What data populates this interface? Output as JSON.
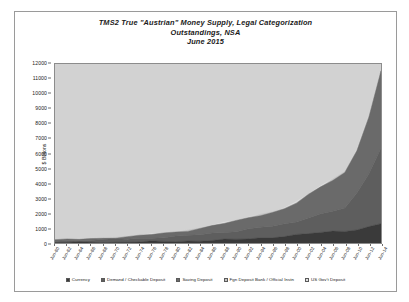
{
  "chart_data": {
    "type": "area",
    "stacked": true,
    "title": "TMS2 True \"Austrian\" Money Supply, Legal Categorization",
    "subtitle": "Outstandings, NSA",
    "subtitle2": "June 2015",
    "xlabel": "",
    "ylabel": "$ Billions",
    "ylim": [
      0,
      12000
    ],
    "ytick_step": 1000,
    "grid": false,
    "legend_position": "bottom",
    "plot_background": "#d2d2d2",
    "ytick_labels": [
      "0",
      "1000",
      "2000",
      "3000",
      "4000",
      "5000",
      "6000",
      "7000",
      "8000",
      "9000",
      "10000",
      "11000",
      "12000"
    ],
    "categories": [
      "Jun-60",
      "Jun-62",
      "Jun-64",
      "Jun-66",
      "Jun-68",
      "Jun-70",
      "Jun-72",
      "Jun-74",
      "Jun-76",
      "Jun-78",
      "Jun-80",
      "Jun-82",
      "Jun-84",
      "Jun-86",
      "Jun-88",
      "Jun-90",
      "Jun-92",
      "Jun-94",
      "Jun-96",
      "Jun-98",
      "Jun-00",
      "Jun-02",
      "Jun-04",
      "Jun-06",
      "Jun-08",
      "Jun-10",
      "Jun-12",
      "Jun-14"
    ],
    "series": [
      {
        "name": "Currency",
        "color": "#3a3a3a",
        "values": [
          30,
          34,
          38,
          42,
          48,
          55,
          62,
          72,
          85,
          100,
          118,
          135,
          155,
          180,
          210,
          245,
          285,
          340,
          395,
          450,
          530,
          620,
          700,
          780,
          830,
          900,
          1070,
          1290
        ]
      },
      {
        "name": "Demand / Checkable Deposit",
        "color": "#5e5e5e",
        "values": [
          120,
          128,
          140,
          152,
          168,
          190,
          210,
          240,
          265,
          290,
          320,
          350,
          400,
          470,
          520,
          560,
          640,
          700,
          720,
          800,
          900,
          1100,
          1250,
          1350,
          1500,
          2400,
          3600,
          5100
        ]
      },
      {
        "name": "Saving Deposit",
        "color": "#6a6a6a",
        "values": [
          60,
          68,
          78,
          90,
          105,
          125,
          150,
          180,
          215,
          255,
          300,
          350,
          420,
          500,
          580,
          660,
          760,
          840,
          930,
          1050,
          1250,
          1500,
          1800,
          2100,
          2400,
          2900,
          3800,
          5100
        ]
      },
      {
        "name": "Fgn Deposit Bank / Official Instn",
        "color": "#c4c4c4",
        "values": [
          2,
          2,
          3,
          3,
          4,
          5,
          6,
          7,
          8,
          9,
          11,
          12,
          14,
          16,
          18,
          20,
          22,
          24,
          26,
          28,
          30,
          32,
          34,
          36,
          38,
          40,
          42,
          45
        ]
      },
      {
        "name": "US Gov't Deposit",
        "color": "#e0e0e0",
        "values": [
          3,
          3,
          4,
          4,
          5,
          6,
          7,
          8,
          9,
          10,
          12,
          13,
          15,
          17,
          19,
          21,
          23,
          25,
          27,
          29,
          31,
          33,
          35,
          38,
          42,
          48,
          55,
          62
        ]
      }
    ],
    "peak_total_approx": 11597
  }
}
